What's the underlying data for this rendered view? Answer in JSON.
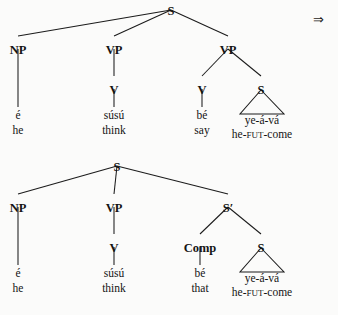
{
  "page": {
    "background_color": "#fbfbfa",
    "ink_color": "#141414",
    "width": 338,
    "height": 315
  },
  "derivation_arrow": {
    "glyph": "⇒",
    "name": "double-right-arrow",
    "x": 313,
    "y": 13
  },
  "trees": [
    {
      "id": "tree-1",
      "name": "surface-structure-tree",
      "nodes": [
        {
          "id": "t1-S",
          "label": "S",
          "x": 171,
          "y": 6,
          "bold": true
        },
        {
          "id": "t1-NP",
          "label": "NP",
          "x": 18,
          "y": 45,
          "bold": true
        },
        {
          "id": "t1-VP1",
          "label": "VP",
          "x": 114,
          "y": 45,
          "bold": true
        },
        {
          "id": "t1-VP2",
          "label": "VP",
          "x": 228,
          "y": 45,
          "bold": true
        },
        {
          "id": "t1-V1",
          "label": "V",
          "x": 114,
          "y": 85,
          "bold": true
        },
        {
          "id": "t1-V2",
          "label": "V",
          "x": 202,
          "y": 85,
          "bold": true
        },
        {
          "id": "t1-S2",
          "label": "S",
          "x": 261,
          "y": 85,
          "bold": true
        }
      ],
      "edges": [
        {
          "from": [
            171,
            10
          ],
          "to": [
            18,
            36
          ]
        },
        {
          "from": [
            171,
            10
          ],
          "to": [
            114,
            36
          ]
        },
        {
          "from": [
            171,
            10
          ],
          "to": [
            228,
            36
          ]
        },
        {
          "from": [
            18,
            49
          ],
          "to": [
            18,
            107
          ]
        },
        {
          "from": [
            114,
            49
          ],
          "to": [
            114,
            76
          ]
        },
        {
          "from": [
            228,
            49
          ],
          "to": [
            202,
            76
          ]
        },
        {
          "from": [
            228,
            49
          ],
          "to": [
            261,
            76
          ]
        },
        {
          "from": [
            114,
            89
          ],
          "to": [
            114,
            107
          ]
        },
        {
          "from": [
            202,
            89
          ],
          "to": [
            202,
            107
          ]
        }
      ],
      "triangles": [
        {
          "apex": [
            261,
            90
          ],
          "left": [
            240,
            114
          ],
          "right": [
            284,
            114
          ]
        }
      ],
      "leaves": [
        {
          "id": "t1-leaf-1",
          "word": "é",
          "gloss": "he",
          "x": 18,
          "word_y": 119,
          "gloss_y": 134
        },
        {
          "id": "t1-leaf-2",
          "word": "súsú",
          "gloss": "think",
          "x": 114,
          "word_y": 119,
          "gloss_y": 134
        },
        {
          "id": "t1-leaf-3",
          "word": "bé",
          "gloss": "say",
          "x": 202,
          "word_y": 119,
          "gloss_y": 134
        },
        {
          "id": "t1-leaf-4",
          "word": "ye-á-vá",
          "gloss_parts": [
            "he-",
            "FUT",
            "-come"
          ],
          "x": 262,
          "word_y": 124,
          "gloss_y": 138
        }
      ]
    },
    {
      "id": "tree-2",
      "name": "deep-structure-tree",
      "nodes": [
        {
          "id": "t2-S",
          "label": "S",
          "x": 117,
          "y": 162,
          "bold": true
        },
        {
          "id": "t2-NP",
          "label": "NP",
          "x": 18,
          "y": 203,
          "bold": true
        },
        {
          "id": "t2-VP",
          "label": "VP",
          "x": 114,
          "y": 203,
          "bold": true
        },
        {
          "id": "t2-Sbar",
          "label": "S′",
          "x": 228,
          "y": 203,
          "bold": true
        },
        {
          "id": "t2-V",
          "label": "V",
          "x": 114,
          "y": 243,
          "bold": true
        },
        {
          "id": "t2-Comp",
          "label": "Comp",
          "x": 200,
          "y": 243,
          "bold": true
        },
        {
          "id": "t2-S2",
          "label": "S",
          "x": 261,
          "y": 243,
          "bold": true
        }
      ],
      "edges": [
        {
          "from": [
            117,
            166
          ],
          "to": [
            18,
            194
          ]
        },
        {
          "from": [
            117,
            166
          ],
          "to": [
            114,
            194
          ]
        },
        {
          "from": [
            117,
            166
          ],
          "to": [
            228,
            194
          ]
        },
        {
          "from": [
            18,
            207
          ],
          "to": [
            18,
            265
          ]
        },
        {
          "from": [
            114,
            207
          ],
          "to": [
            114,
            234
          ]
        },
        {
          "from": [
            228,
            207
          ],
          "to": [
            200,
            234
          ]
        },
        {
          "from": [
            228,
            207
          ],
          "to": [
            261,
            234
          ]
        },
        {
          "from": [
            114,
            247
          ],
          "to": [
            114,
            265
          ]
        },
        {
          "from": [
            200,
            247
          ],
          "to": [
            200,
            265
          ]
        }
      ],
      "triangles": [
        {
          "apex": [
            261,
            248
          ],
          "left": [
            240,
            272
          ],
          "right": [
            284,
            272
          ]
        }
      ],
      "leaves": [
        {
          "id": "t2-leaf-1",
          "word": "é",
          "gloss": "he",
          "x": 18,
          "word_y": 277,
          "gloss_y": 292
        },
        {
          "id": "t2-leaf-2",
          "word": "súsú",
          "gloss": "think",
          "x": 114,
          "word_y": 277,
          "gloss_y": 292
        },
        {
          "id": "t2-leaf-3",
          "word": "bé",
          "gloss": "that",
          "x": 200,
          "word_y": 277,
          "gloss_y": 292
        },
        {
          "id": "t2-leaf-4",
          "word": "ye-á-vá",
          "gloss_parts": [
            "he-",
            "FUT",
            "-come"
          ],
          "x": 262,
          "word_y": 282,
          "gloss_y": 296
        }
      ]
    }
  ]
}
